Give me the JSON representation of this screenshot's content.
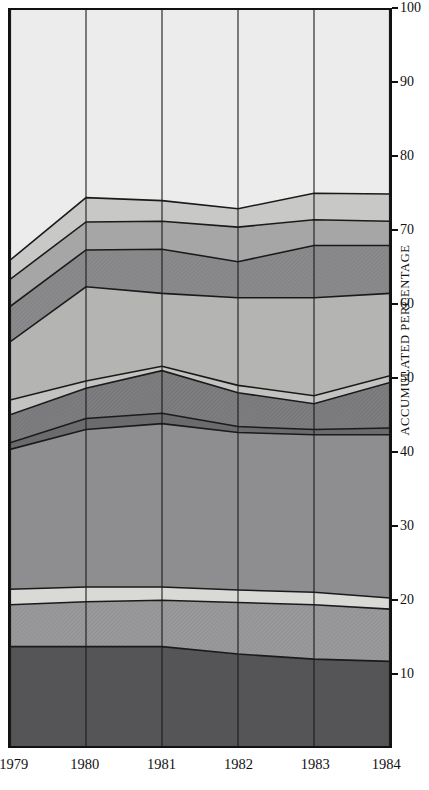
{
  "chart_data": {
    "type": "area",
    "title": "",
    "subtitle": "",
    "xlabel": "",
    "ylabel": "ACCUMULATED PERCENTAGE",
    "categories": [
      "1979",
      "1980",
      "1981",
      "1982",
      "1983",
      "1984"
    ],
    "x": [
      1979,
      1980,
      1981,
      1982,
      1983,
      1984
    ],
    "ylim": [
      0,
      100
    ],
    "xlim": [
      1979,
      1984
    ],
    "grid": false,
    "legend": "none",
    "yticks": [
      10,
      20,
      30,
      40,
      50,
      60,
      70,
      80,
      90,
      100
    ],
    "stacked": true,
    "stacking_order": "bottom-to-top",
    "cumulative_boundaries": [
      {
        "name": "boundary-1",
        "values": [
          13.5,
          13.5,
          13.5,
          12.5,
          11.8,
          11.5
        ]
      },
      {
        "name": "boundary-2",
        "values": [
          19.2,
          19.6,
          19.8,
          19.5,
          19.2,
          18.6
        ]
      },
      {
        "name": "boundary-3",
        "values": [
          21.3,
          21.6,
          21.6,
          21.2,
          20.9,
          20.1
        ]
      },
      {
        "name": "boundary-4",
        "values": [
          40.3,
          43.0,
          43.8,
          42.6,
          42.3,
          42.3
        ]
      },
      {
        "name": "boundary-5",
        "values": [
          41.2,
          44.5,
          45.2,
          43.4,
          43.0,
          43.2
        ]
      },
      {
        "name": "boundary-6",
        "values": [
          45.0,
          48.6,
          51.0,
          48.0,
          46.5,
          49.4
        ]
      },
      {
        "name": "boundary-7",
        "values": [
          47.0,
          49.6,
          51.6,
          49.0,
          47.6,
          50.3
        ]
      },
      {
        "name": "boundary-8",
        "values": [
          54.9,
          62.4,
          61.5,
          60.9,
          60.9,
          61.5
        ]
      },
      {
        "name": "boundary-9",
        "values": [
          59.7,
          67.4,
          67.5,
          65.8,
          68.0,
          68.0
        ]
      },
      {
        "name": "boundary-10",
        "values": [
          63.4,
          71.2,
          71.3,
          70.5,
          71.5,
          71.3
        ]
      },
      {
        "name": "boundary-11",
        "values": [
          66.0,
          74.5,
          74.1,
          73.0,
          75.1,
          75.0
        ]
      }
    ],
    "bands": [
      {
        "id": "band-1",
        "from": "0",
        "to": "boundary-1",
        "fill": "#555558",
        "pattern": "none"
      },
      {
        "id": "band-2",
        "from": "boundary-1",
        "to": "boundary-2",
        "fill": "#9a9a9c",
        "pattern": "hatch"
      },
      {
        "id": "band-3",
        "from": "boundary-2",
        "to": "boundary-3",
        "fill": "#d9d9d6",
        "pattern": "none"
      },
      {
        "id": "band-4",
        "from": "boundary-3",
        "to": "boundary-4",
        "fill": "#8e8e90",
        "pattern": "none"
      },
      {
        "id": "band-5",
        "from": "boundary-4",
        "to": "boundary-5",
        "fill": "#6b6b6e",
        "pattern": "none"
      },
      {
        "id": "band-6",
        "from": "boundary-5",
        "to": "boundary-6",
        "fill": "#7e7e81",
        "pattern": "hatch"
      },
      {
        "id": "band-7",
        "from": "boundary-6",
        "to": "boundary-7",
        "fill": "#c3c3c1",
        "pattern": "none"
      },
      {
        "id": "band-8",
        "from": "boundary-7",
        "to": "boundary-8",
        "fill": "#b4b4b3",
        "pattern": "none"
      },
      {
        "id": "band-9",
        "from": "boundary-8",
        "to": "boundary-9",
        "fill": "#8b8b8d",
        "pattern": "hatch"
      },
      {
        "id": "band-10",
        "from": "boundary-9",
        "to": "boundary-10",
        "fill": "#a6a6a6",
        "pattern": "none"
      },
      {
        "id": "band-11",
        "from": "boundary-10",
        "to": "boundary-11",
        "fill": "#c8c8c7",
        "pattern": "none"
      },
      {
        "id": "band-12",
        "from": "boundary-11",
        "to": "100",
        "fill": "#ececed",
        "pattern": "none"
      }
    ],
    "colors": {
      "axis": "#111111",
      "outline": "#1a1a1a",
      "background": "#ffffff"
    }
  },
  "axes": {
    "y_label": "ACCUMULATED PERCENTAGE",
    "y_ticks": [
      "10",
      "20",
      "30",
      "40",
      "50",
      "60",
      "70",
      "80",
      "90",
      "100"
    ],
    "x_ticks": [
      "1979",
      "1980",
      "1981",
      "1982",
      "1983",
      "1984"
    ]
  }
}
